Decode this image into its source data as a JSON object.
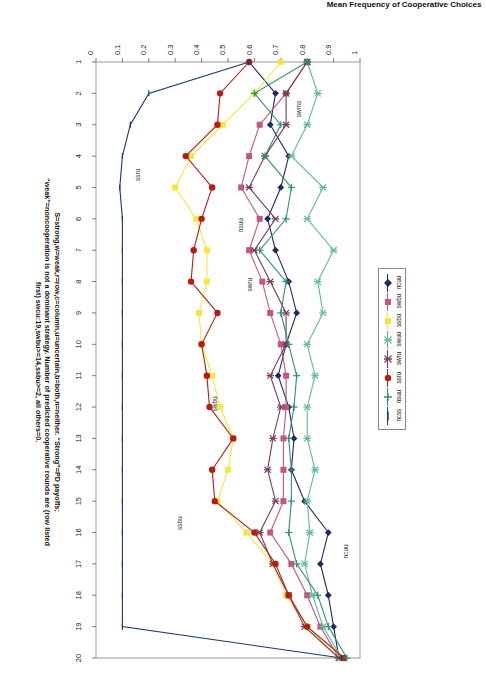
{
  "chart_data": {
    "type": "line",
    "title": "",
    "xlabel": "",
    "ylabel": "Mean Frequency of Cooperative Choices",
    "xlim": [
      1,
      20
    ],
    "ylim": [
      0,
      1
    ],
    "xticks": [
      1,
      2,
      3,
      4,
      5,
      6,
      7,
      8,
      9,
      10,
      11,
      12,
      13,
      14,
      15,
      16,
      17,
      18,
      19,
      20
    ],
    "yticks": [
      0,
      0.1,
      0.2,
      0.3,
      0.4,
      0.5,
      0.6,
      0.7,
      0.8,
      0.9,
      1
    ],
    "ytick_labels": [
      "0",
      "0.1",
      "0.2",
      "0.3",
      "0.4",
      "0.5",
      "0.6",
      "0.7",
      "0.8",
      "0.9",
      "1"
    ],
    "grid": false,
    "legend_position": "top-outside",
    "x": [
      1,
      2,
      3,
      4,
      5,
      6,
      7,
      8,
      9,
      10,
      11,
      12,
      13,
      14,
      15,
      16,
      17,
      18,
      19,
      20
    ],
    "series": [
      {
        "name": "ncuu",
        "color": "#1f2a63",
        "marker": "diamond",
        "values": [
          0.58,
          0.68,
          0.66,
          0.73,
          0.7,
          0.65,
          0.68,
          0.73,
          0.76,
          0.72,
          0.69,
          0.73,
          0.75,
          0.74,
          0.79,
          0.88,
          0.85,
          0.88,
          0.9,
          0.92
        ]
      },
      {
        "name": "swbu",
        "color": "#c4577c",
        "marker": "square",
        "values": [
          0.8,
          0.72,
          0.62,
          0.58,
          0.55,
          0.62,
          0.58,
          0.63,
          0.66,
          0.7,
          0.72,
          0.72,
          0.71,
          0.71,
          0.71,
          0.66,
          0.74,
          0.8,
          0.85,
          0.92
        ]
      },
      {
        "name": "ssbu",
        "color": "#f4e743",
        "marker": "square",
        "values": [
          0.7,
          0.6,
          0.48,
          0.36,
          0.3,
          0.38,
          0.42,
          0.42,
          0.39,
          0.4,
          0.44,
          0.47,
          0.52,
          0.5,
          0.46,
          0.57,
          0.67,
          0.72,
          0.8,
          0.92
        ]
      },
      {
        "name": "swuu",
        "color": "#5fb99a",
        "marker": "star",
        "values": [
          0.8,
          0.84,
          0.8,
          0.74,
          0.86,
          0.8,
          0.9,
          0.84,
          0.86,
          0.8,
          0.83,
          0.8,
          0.8,
          0.83,
          0.8,
          0.81,
          0.79,
          0.82,
          0.86,
          0.93
        ]
      },
      {
        "name": "swru",
        "color": "#7a3b5e",
        "marker": "star",
        "values": [
          0.8,
          0.72,
          0.72,
          0.64,
          0.58,
          0.68,
          0.6,
          0.66,
          0.72,
          0.72,
          0.66,
          0.7,
          0.67,
          0.65,
          0.68,
          0.62,
          0.67,
          0.73,
          0.79,
          0.92
        ]
      },
      {
        "name": "ssru",
        "color": "#b51d12",
        "marker": "circle",
        "values": [
          0.58,
          0.47,
          0.46,
          0.34,
          0.44,
          0.4,
          0.37,
          0.36,
          0.46,
          0.4,
          0.42,
          0.43,
          0.52,
          0.44,
          0.45,
          0.6,
          0.68,
          0.73,
          0.8,
          0.94
        ]
      },
      {
        "name": "nsuu",
        "color": "#2f8f72",
        "marker": "plus",
        "values": [
          0.8,
          0.6,
          0.7,
          0.64,
          0.74,
          0.72,
          0.62,
          0.72,
          0.7,
          0.73,
          0.76,
          0.75,
          0.73,
          0.74,
          0.74,
          0.73,
          0.76,
          0.84,
          0.88,
          0.95
        ]
      },
      {
        "name": "ncss",
        "color": "#1b3a6b",
        "marker": "line",
        "values": [
          0.58,
          0.2,
          0.13,
          0.1,
          0.09,
          0.1,
          0.1,
          0.1,
          0.1,
          0.1,
          0.1,
          0.1,
          0.1,
          0.1,
          0.1,
          0.1,
          0.1,
          0.1,
          0.1,
          0.93
        ]
      }
    ],
    "annotations": [
      {
        "text": "ncuu",
        "x": 16.6,
        "y": 0.955
      },
      {
        "text": "swru",
        "x": 8.1,
        "y": 0.59
      },
      {
        "text": "nsuu",
        "x": 6.2,
        "y": 0.555
      },
      {
        "text": "swms",
        "x": 2.5,
        "y": 0.775
      },
      {
        "text": "ssru",
        "x": 4.6,
        "y": 0.165
      },
      {
        "text": "swbu",
        "x": 11.9,
        "y": 0.46
      },
      {
        "text": "ssbu",
        "x": 15.7,
        "y": 0.325
      }
    ]
  },
  "legend": {
    "items": [
      {
        "label": "ncuu"
      },
      {
        "label": "swbu"
      },
      {
        "label": "ssbu"
      },
      {
        "label": "swuu"
      },
      {
        "label": "swru"
      },
      {
        "label": "ssru"
      },
      {
        "label": "nsuu"
      },
      {
        "label": "ncss"
      }
    ]
  },
  "caption": {
    "line1": "S=strong,w=weak,r=row,c=column,u=uncertain,b=both,n=neither. “Strong”=PD payoffs;",
    "line2": "“weak”=noncooperation is not a dominant strategy. Number of predicted cooperative rounds are (row listed",
    "line3": "first) swcu:19,swbu>=14,ssbu>=2, all others=0."
  },
  "axes": {
    "y_title": "Mean Frequency of Cooperative Choices"
  }
}
